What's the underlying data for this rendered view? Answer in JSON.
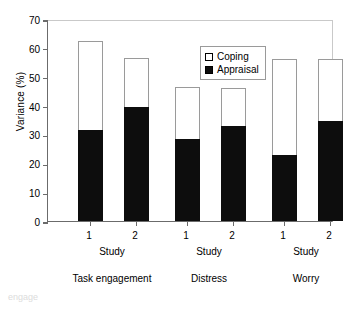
{
  "chart_data": {
    "type": "bar",
    "title": "",
    "xlabel": "",
    "ylabel": "Variance (%)",
    "ylim": [
      0,
      70
    ],
    "yticks": [
      0,
      10,
      20,
      30,
      40,
      50,
      60,
      70
    ],
    "grid": false,
    "stacked": true,
    "legend_position": "top-center-inside",
    "legend": [
      "Coping",
      "Appraisal"
    ],
    "groups": [
      "Task engagement",
      "Distress",
      "Worry"
    ],
    "group_sub_label": "Study",
    "categories": [
      "1",
      "2",
      "1",
      "2",
      "1",
      "2"
    ],
    "series": [
      {
        "name": "Appraisal",
        "color": "#0d0d0d",
        "values": [
          31.5,
          39.5,
          28.5,
          33.0,
          23.0,
          34.5
        ]
      },
      {
        "name": "Coping",
        "color": "#ffffff",
        "values": [
          31.0,
          17.0,
          18.0,
          13.0,
          33.0,
          21.5
        ]
      }
    ],
    "totals": [
      62.5,
      56.5,
      46.5,
      46.0,
      56.0,
      56.0
    ]
  },
  "figure": {
    "ylabel": "Variance (%)",
    "study_word": "Study",
    "legend": {
      "coping": "Coping",
      "appraisal": "Appraisal"
    },
    "bars": [
      {
        "study": "1",
        "total": 62.5,
        "appraisal": 31.5
      },
      {
        "study": "2",
        "total": 56.5,
        "appraisal": 39.5
      },
      {
        "study": "1",
        "total": 46.5,
        "appraisal": 28.5
      },
      {
        "study": "2",
        "total": 46.0,
        "appraisal": 33.0
      },
      {
        "study": "1",
        "total": 56.0,
        "appraisal": 23.0
      },
      {
        "study": "2",
        "total": 56.0,
        "appraisal": 34.5
      }
    ],
    "groups": [
      {
        "label": "Task engagement"
      },
      {
        "label": "Distress"
      },
      {
        "label": "Worry"
      }
    ],
    "yticks": [
      "70",
      "60",
      "50",
      "40",
      "30",
      "20",
      "10",
      "0"
    ],
    "artifact_text": "engage"
  }
}
